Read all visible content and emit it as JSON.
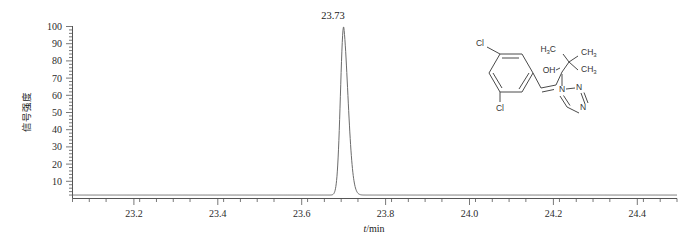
{
  "chart_data": {
    "type": "line",
    "title": "",
    "subtitle": "",
    "xlabel": "t/min",
    "ylabel": "信号强度",
    "xlim": [
      23.08,
      24.52
    ],
    "ylim": [
      0,
      104
    ],
    "xticks": [
      "23.2",
      "23.4",
      "23.6",
      "23.8",
      "24.0",
      "24.2",
      "24.4"
    ],
    "xtick_values": [
      23.2,
      23.4,
      23.6,
      23.8,
      24.0,
      24.2,
      24.4
    ],
    "yticks": [
      "10",
      "20",
      "30",
      "40",
      "50",
      "60",
      "70",
      "80",
      "90",
      "100"
    ],
    "ytick_values": [
      10,
      20,
      30,
      40,
      50,
      60,
      70,
      80,
      90,
      100
    ],
    "grid": false,
    "legend": "none",
    "minor_ticks": true,
    "annotations": [
      {
        "text": "23.73",
        "x": 23.726,
        "y": 100
      }
    ],
    "series": [
      {
        "name": "chromatogram",
        "color": "#6b6b6b",
        "peak_retention_time": 23.726,
        "peak_height": 100,
        "peak_width_half_max": 0.018,
        "baseline": 2,
        "x": [
          23.08,
          23.2,
          23.4,
          23.6,
          23.64,
          23.66,
          23.68,
          23.69,
          23.7,
          23.705,
          23.71,
          23.715,
          23.72,
          23.726,
          23.732,
          23.738,
          23.744,
          23.75,
          23.756,
          23.762,
          23.77,
          23.78,
          23.8,
          23.83,
          23.88,
          23.95,
          24.1,
          24.3,
          24.5
        ],
        "y": [
          2.0,
          2.0,
          2.0,
          2.1,
          2.2,
          2.4,
          3.2,
          5.0,
          11.0,
          20.0,
          36.0,
          58.0,
          82.0,
          100.0,
          93.0,
          74.0,
          54.0,
          37.0,
          25.0,
          17.0,
          10.5,
          6.5,
          3.6,
          2.6,
          2.2,
          2.1,
          2.0,
          2.0,
          2.0
        ]
      }
    ]
  },
  "structure": {
    "name": "diniconazole-structure",
    "atoms": {
      "cl_top": "Cl",
      "cl_bottom": "Cl",
      "hydroxyl": "OH",
      "methyl_a_main": "H",
      "methyl_a_sub": "3",
      "methyl_a_tail": "C",
      "methyl_b_main": "CH",
      "methyl_b_sub": "3",
      "methyl_c_main": "CH",
      "methyl_c_sub": "3",
      "n1": "N",
      "n2": "N",
      "n3": "N"
    }
  }
}
